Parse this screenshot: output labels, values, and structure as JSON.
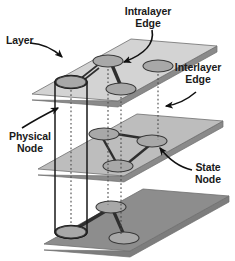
{
  "figure": {
    "kind": "multilayer-network-diagram",
    "background": "#ffffff"
  },
  "labels": {
    "layer": "Layer",
    "intralayer_edge_line1": "Intralayer",
    "intralayer_edge_line2": "Edge",
    "interlayer_edge_line1": "Interlayer",
    "interlayer_edge_line2": "Edge",
    "physical_node_line1": "Physical",
    "physical_node_line2": "Node",
    "state_node_line1": "State",
    "state_node_line2": "Node"
  },
  "colors": {
    "top_layer_fill": "#d3d3d3",
    "middle_layer_fill": "#bdbdbd",
    "bottom_layer_fill": "#8d8d8d",
    "layer_side": "#8a8a8a",
    "layer_edge_stroke": "#6e6e6e",
    "node_fill": "#a8a8a8",
    "node_stroke": "#3a3a3a",
    "intralayer_edge": "#2e2e2e",
    "interlayer_edge": "#555555",
    "cylinder_stroke": "#1a1a1a",
    "text": "#1a1a1a",
    "arrow": "#111111"
  },
  "layers": [
    {
      "id": "top-layer",
      "name": "top layer",
      "fill": "#d3d3d3",
      "nodes": [
        {
          "id": "t-left",
          "cx": 71,
          "cy": 82,
          "rx": 15,
          "ry": 6
        },
        {
          "id": "t-mid",
          "cx": 108,
          "cy": 61,
          "rx": 15,
          "ry": 6
        },
        {
          "id": "t-low",
          "cx": 121,
          "cy": 89,
          "rx": 15,
          "ry": 6
        },
        {
          "id": "t-right",
          "cx": 158,
          "cy": 66,
          "rx": 15,
          "ry": 6
        }
      ],
      "intralayer_edges": [
        [
          "t-left",
          "t-mid"
        ],
        [
          "t-mid",
          "t-low"
        ]
      ]
    },
    {
      "id": "middle-layer",
      "name": "middle layer",
      "fill": "#bdbdbd",
      "nodes": [
        {
          "id": "m-a",
          "cx": 104,
          "cy": 134,
          "rx": 15,
          "ry": 6
        },
        {
          "id": "m-b",
          "cx": 152,
          "cy": 141,
          "rx": 15,
          "ry": 6
        },
        {
          "id": "m-c",
          "cx": 118,
          "cy": 166,
          "rx": 15,
          "ry": 6
        }
      ],
      "intralayer_edges": [
        [
          "m-a",
          "m-b"
        ],
        [
          "m-a",
          "m-c"
        ],
        [
          "m-c",
          "m-b"
        ]
      ]
    },
    {
      "id": "bottom-layer",
      "name": "bottom layer",
      "fill": "#8d8d8d",
      "nodes": [
        {
          "id": "b-left",
          "cx": 71,
          "cy": 232,
          "rx": 15,
          "ry": 6
        },
        {
          "id": "b-mid",
          "cx": 111,
          "cy": 207,
          "rx": 15,
          "ry": 6
        },
        {
          "id": "b-low",
          "cx": 124,
          "cy": 238,
          "rx": 15,
          "ry": 6
        }
      ],
      "intralayer_edges": [
        [
          "b-left",
          "b-mid"
        ],
        [
          "b-mid",
          "b-low"
        ]
      ]
    }
  ],
  "interlayer_edges": [
    {
      "x": 71,
      "y1": 82,
      "y2": 232
    },
    {
      "x": 108,
      "y1": 61,
      "y2": 207
    },
    {
      "x": 121,
      "y1": 89,
      "y2": 238
    },
    {
      "x": 158,
      "y1": 66,
      "y2": 141
    }
  ],
  "physical_node": {
    "id": "physical-node-cylinder",
    "cx": 71,
    "top_y": 82,
    "bottom_y": 232,
    "rx": 16,
    "ry": 6.5
  },
  "annotations": [
    {
      "id": "layer-arrow",
      "from": [
        46,
        46
      ],
      "to": [
        73,
        59
      ]
    },
    {
      "id": "intralayer-edge-arrow",
      "from": [
        150,
        33
      ],
      "to": [
        122,
        62
      ]
    },
    {
      "id": "interlayer-edge-arrow",
      "from": [
        193,
        96
      ],
      "to": [
        163,
        106
      ]
    },
    {
      "id": "physical-node-arrow",
      "from": [
        35,
        128
      ],
      "to": [
        62,
        107
      ]
    },
    {
      "id": "state-node-arrow",
      "from": [
        188,
        171
      ],
      "to": [
        160,
        148
      ]
    }
  ]
}
